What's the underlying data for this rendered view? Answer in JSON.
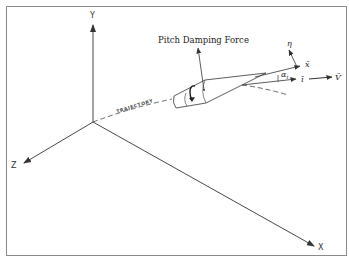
{
  "figure": {
    "frame_color": "#8a8a8a",
    "line_color": "#333333",
    "axes": {
      "y_label": "Y",
      "z_label": "Z",
      "x_label": "X"
    },
    "trajectory_label": "TRAJECTORY",
    "force_label": "Pitch Damping Force",
    "vectors": {
      "eta_label": "η",
      "x_bar_label": "x̄",
      "i_bar_label": "ī",
      "v_bar_label": "V̄",
      "alpha_label": "α",
      "alpha_subscript": "t"
    }
  }
}
